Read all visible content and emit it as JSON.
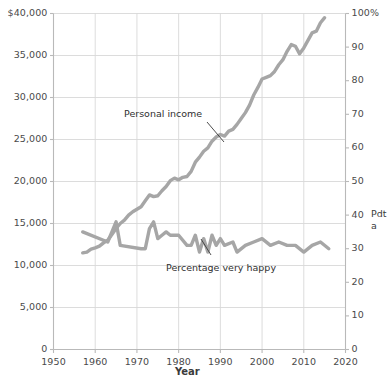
{
  "chart_data": {
    "type": "line",
    "title": "",
    "xlabel": "Year",
    "ylabel_left": "",
    "ylabel_right": "",
    "xlim": [
      1950,
      2020
    ],
    "xticks": [
      "1950",
      "1960",
      "1970",
      "1980",
      "1990",
      "2000",
      "2010",
      "2020"
    ],
    "ylim_left": [
      0,
      40000
    ],
    "yticks_left": [
      "$40,000",
      "35,000",
      "30,000",
      "25,000",
      "20,000",
      "15,000",
      "10,000",
      "5,000",
      "0"
    ],
    "ylim_right": [
      0,
      100
    ],
    "yticks_right": [
      "100%",
      "90",
      "80",
      "70",
      "60",
      "50",
      "40",
      "30",
      "20",
      "10",
      "0"
    ],
    "grid": true,
    "legend_position": "inline-annotations",
    "line_color": "#a6a6a6",
    "annotations": [
      {
        "text": "Personal income",
        "series": "personal_income"
      },
      {
        "text": "Percentage very happy",
        "series": "percentage_very_happy"
      }
    ],
    "right_side_note": "Pdta",
    "series": [
      {
        "name": "Personal income",
        "axis": "left",
        "units": "dollars",
        "x": [
          1957,
          1958,
          1959,
          1960,
          1961,
          1962,
          1963,
          1964,
          1965,
          1966,
          1967,
          1968,
          1969,
          1970,
          1971,
          1972,
          1973,
          1974,
          1975,
          1976,
          1977,
          1978,
          1979,
          1980,
          1981,
          1982,
          1983,
          1984,
          1985,
          1986,
          1987,
          1988,
          1989,
          1990,
          1991,
          1992,
          1993,
          1994,
          1995,
          1996,
          1997,
          1998,
          1999,
          2000,
          2001,
          2002,
          2003,
          2004,
          2005,
          2006,
          2007,
          2008,
          2009,
          2010,
          2011,
          2012,
          2013,
          2014,
          2015
        ],
        "values": [
          11500,
          11600,
          11950,
          12100,
          12300,
          12700,
          13000,
          13700,
          14400,
          15000,
          15400,
          16000,
          16400,
          16700,
          17000,
          17700,
          18400,
          18200,
          18300,
          18900,
          19400,
          20100,
          20400,
          20200,
          20500,
          20600,
          21200,
          22300,
          22900,
          23600,
          24000,
          24800,
          25300,
          25600,
          25400,
          26000,
          26200,
          26800,
          27500,
          28200,
          29100,
          30300,
          31200,
          32200,
          32400,
          32600,
          33100,
          33900,
          34500,
          35500,
          36300,
          36100,
          35200,
          35900,
          36800,
          37700,
          37900,
          38900,
          39500
        ]
      },
      {
        "name": "Percentage very happy",
        "axis": "right",
        "units": "percent",
        "x": [
          1957,
          1963,
          1965,
          1966,
          1971,
          1972,
          1973,
          1974,
          1975,
          1976,
          1977,
          1978,
          1980,
          1982,
          1983,
          1984,
          1985,
          1986,
          1987,
          1988,
          1989,
          1990,
          1991,
          1993,
          1994,
          1996,
          1998,
          2000,
          2002,
          2004,
          2006,
          2008,
          2010,
          2012,
          2014,
          2016
        ],
        "values": [
          35,
          32,
          38,
          31,
          30,
          30,
          36,
          38,
          33,
          34,
          35,
          34,
          34,
          31,
          31,
          34,
          29,
          33,
          29,
          34,
          31,
          33,
          31,
          32,
          29,
          31,
          32,
          33,
          31,
          32,
          31,
          31,
          29,
          31,
          32,
          30
        ]
      }
    ]
  },
  "axes": {
    "x_title": "Year"
  }
}
